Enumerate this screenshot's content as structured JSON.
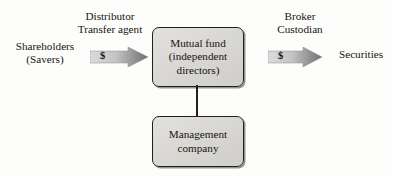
{
  "diagram": {
    "background_color": "#fdfdfc",
    "text_color": "#17140f",
    "box_fill_color": "#dbdad7",
    "box_border_color": "#231f1c",
    "arrow_light_color": "#d8d8d8",
    "arrow_dark_color": "#6e6e6e"
  },
  "labels": {
    "shareholders": {
      "line1": "Shareholders",
      "line2": "(Savers)"
    },
    "distributor": {
      "line1": "Distributor",
      "line2": "Transfer agent"
    },
    "broker": {
      "line1": "Broker",
      "line2": "Custodian"
    },
    "securities": {
      "line1": "Securities"
    }
  },
  "boxes": {
    "mutual_fund": {
      "line1": "Mutual fund",
      "line2": "(independent",
      "line3": "directors)"
    },
    "management": {
      "line1": "Management",
      "line2": "company"
    }
  },
  "arrows": {
    "left": {
      "symbol": "$",
      "direction": "right",
      "from": "Shareholders (Savers)",
      "to": "Mutual fund"
    },
    "right": {
      "symbol": "$",
      "direction": "right",
      "from": "Mutual fund",
      "to": "Securities"
    }
  },
  "connector": {
    "from": "Mutual fund",
    "to": "Management company"
  }
}
